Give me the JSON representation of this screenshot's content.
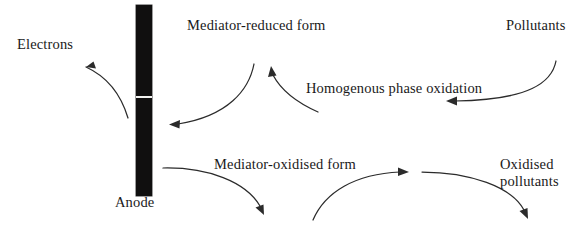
{
  "diagram": {
    "canvas": {
      "width": 587,
      "height": 229
    },
    "colors": {
      "background": "#ffffff",
      "text": "#1a1a1a",
      "stroke": "#2b2b2b",
      "electrode_fill": "#100f0f",
      "electrode_gap": "#f2f2f0"
    },
    "labels": {
      "electrons": "Electrons",
      "anode": "Anode",
      "mediator_reduced": "Mediator-reduced form",
      "homogenous_phase_oxidation": "Homogenous phase oxidation",
      "pollutants": "Pollutants",
      "mediator_oxidised": "Mediator-oxidised form",
      "oxidised_pollutants": "Oxidised\npollutants"
    },
    "elements": {
      "electrode": {
        "name": "Anode",
        "shape": "vertical-bar",
        "x": 136,
        "y": 5,
        "width": 16,
        "height": 191,
        "gap_y": 96,
        "gap_height": 2
      }
    },
    "arrows": [
      {
        "name": "electrons-arrow",
        "from": "anode",
        "to": "electrons",
        "direction": "up-left"
      },
      {
        "name": "mediator-reduced-to-anode-arrow",
        "from": "mediator-reduced form",
        "to": "anode",
        "direction": "down-left"
      },
      {
        "name": "homogenous-oxidation-to-mediator-reduced-arrow",
        "from": "homogenous phase oxidation",
        "to": "mediator-reduced form",
        "direction": "up"
      },
      {
        "name": "pollutants-to-homogenous-oxidation-arrow",
        "from": "pollutants",
        "to": "homogenous phase oxidation",
        "direction": "down-left"
      },
      {
        "name": "anode-to-mediator-oxidised-arrow",
        "from": "anode",
        "to": "mediator-oxidised form",
        "direction": "down-right"
      },
      {
        "name": "mediator-oxidised-to-reaction-arrow",
        "from": "mediator-oxidised form",
        "to": "reaction zone",
        "direction": "up-right"
      },
      {
        "name": "reaction-to-oxidised-pollutants-arrow",
        "from": "reaction zone",
        "to": "oxidised pollutants",
        "direction": "down-right"
      }
    ]
  }
}
